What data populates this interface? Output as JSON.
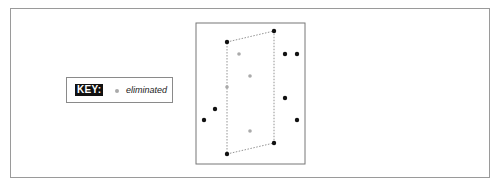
{
  "key": {
    "label": "KEY:",
    "entries": [
      {
        "marker": "grey-dot",
        "color": "#aaaaaa",
        "text": "eliminated"
      }
    ]
  },
  "diagram": {
    "box": {
      "x": 196,
      "y": 23,
      "width": 109,
      "height": 141
    },
    "hull": [
      [
        227,
        42
      ],
      [
        274,
        31
      ],
      [
        274,
        143
      ],
      [
        227,
        154
      ]
    ],
    "points_active": [
      [
        227,
        42
      ],
      [
        274,
        31
      ],
      [
        285,
        54
      ],
      [
        297,
        54
      ],
      [
        285,
        98
      ],
      [
        215,
        109
      ],
      [
        204,
        120
      ],
      [
        297,
        120
      ],
      [
        274,
        143
      ],
      [
        227,
        154
      ]
    ],
    "points_eliminated": [
      [
        239,
        54
      ],
      [
        250,
        76
      ],
      [
        227,
        87
      ],
      [
        250,
        131
      ]
    ],
    "colors": {
      "active": "#111111",
      "eliminated": "#aaaaaa",
      "hull": "#777777"
    }
  }
}
